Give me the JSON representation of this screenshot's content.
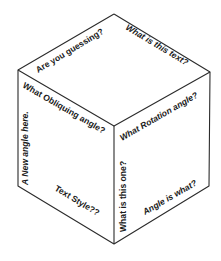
{
  "figure": {
    "type": "isometric-cube",
    "background": "#ffffff",
    "line_color": "#2b2b2b",
    "text_color": "#1a1a1a",
    "vertices": {
      "top": [
        114,
        14
      ],
      "left_top": [
        18,
        70
      ],
      "right_top": [
        210,
        72
      ],
      "center": [
        114,
        126
      ],
      "left_bottom": [
        18,
        186
      ],
      "bottom": [
        114,
        244
      ],
      "right_bottom": [
        209,
        186
      ]
    }
  },
  "faces": {
    "top": {
      "labels": [
        {
          "text": "Are you guessing?",
          "style": "bold",
          "rotation": -30
        },
        {
          "text": "What is this text?",
          "style": "bold-italic",
          "rotation": 30
        }
      ]
    },
    "left": {
      "labels": [
        {
          "text": "What Obliquing angle?",
          "style": "bold",
          "rotation": 30
        },
        {
          "text": "A New angle here.",
          "style": "bold-italic",
          "rotation": -90
        },
        {
          "text": "Text Style??",
          "style": "bold",
          "rotation": 30
        }
      ]
    },
    "right": {
      "labels": [
        {
          "text": "What Rotation angle?",
          "style": "bold-italic",
          "rotation": -30
        },
        {
          "text": "What is this one?",
          "style": "bold",
          "rotation": -90
        },
        {
          "text": "Angle is what?",
          "style": "bold-italic",
          "rotation": -30
        }
      ]
    }
  }
}
